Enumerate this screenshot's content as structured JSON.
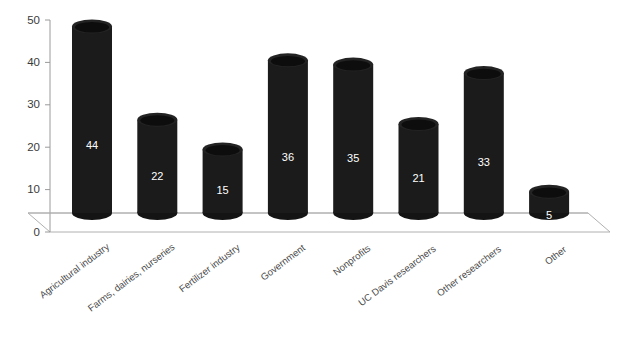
{
  "chart_data": {
    "type": "bar",
    "title": "",
    "subtitle": "",
    "xlabel": "",
    "ylabel": "",
    "ylim": [
      0,
      50
    ],
    "ytick_values": [
      0,
      10,
      20,
      30,
      40,
      50
    ],
    "ytick_labels": [
      "0",
      "10",
      "20",
      "30",
      "40",
      "50"
    ],
    "grid": false,
    "legend": false,
    "legend_position": "none",
    "style": "3d-cylinder",
    "bar_color": "#1b1b1b",
    "value_label_color": "#ffffff",
    "axis_color": "#9a9a9a",
    "background_color": "#ffffff",
    "categories": [
      "Agricultural industry",
      "Farms, dairies, nurseries",
      "Fertilizer industry",
      "Government",
      "Nonprofits",
      "UC Davis researchers",
      "Other researchers",
      "Other"
    ],
    "values": [
      44,
      22,
      15,
      36,
      35,
      21,
      33,
      5
    ],
    "value_labels": [
      "44",
      "22",
      "15",
      "36",
      "35",
      "21",
      "33",
      "5"
    ]
  }
}
